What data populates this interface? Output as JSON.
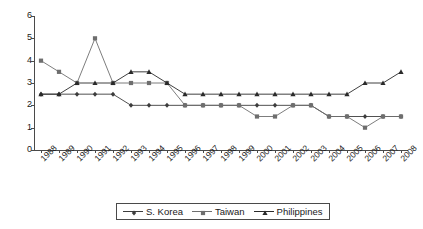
{
  "chart_data": {
    "type": "line",
    "title": "",
    "subtitle": "",
    "xlabel": "",
    "ylabel": "",
    "grid": false,
    "legend_position": "bottom",
    "categories": [
      "1988",
      "1989",
      "1990",
      "1991",
      "1992",
      "1993",
      "1994",
      "1995",
      "1996",
      "1997",
      "1998",
      "1999",
      "2000",
      "2001",
      "2002",
      "2003",
      "2004",
      "2005",
      "2006",
      "2007",
      "2008"
    ],
    "ylim": [
      0,
      6
    ],
    "yticks": [
      0,
      1,
      2,
      3,
      4,
      5,
      6
    ],
    "ytick_labels": [
      "0",
      "1",
      "2",
      "3",
      "4",
      "5",
      "6"
    ],
    "series": [
      {
        "name": "S. Korea",
        "marker": "diamond",
        "color": "#3d3d3d",
        "values": [
          2.5,
          2.5,
          2.5,
          2.5,
          2.5,
          2.0,
          2.0,
          2.0,
          2.0,
          2.0,
          2.0,
          2.0,
          2.0,
          2.0,
          2.0,
          2.0,
          1.5,
          1.5,
          1.5,
          1.5,
          1.5
        ]
      },
      {
        "name": "Taiwan",
        "marker": "square",
        "color": "#6e6e6e",
        "values": [
          4.0,
          3.5,
          3.0,
          5.0,
          3.0,
          3.0,
          3.0,
          3.0,
          2.0,
          2.0,
          2.0,
          2.0,
          1.5,
          1.5,
          2.0,
          2.0,
          1.5,
          1.5,
          1.0,
          1.5,
          1.5
        ]
      },
      {
        "name": "Philippines",
        "marker": "triangle",
        "color": "#2a2a2a",
        "values": [
          2.5,
          2.5,
          3.0,
          3.0,
          3.0,
          3.5,
          3.5,
          3.0,
          2.5,
          2.5,
          2.5,
          2.5,
          2.5,
          2.5,
          2.5,
          2.5,
          2.5,
          2.5,
          3.0,
          3.0,
          3.5
        ]
      }
    ]
  },
  "legend": {
    "items": [
      {
        "label": "S. Korea",
        "marker": "diamond-marker-icon"
      },
      {
        "label": "Taiwan",
        "marker": "square-marker-icon"
      },
      {
        "label": "Philippines",
        "marker": "triangle-marker-icon"
      }
    ]
  }
}
